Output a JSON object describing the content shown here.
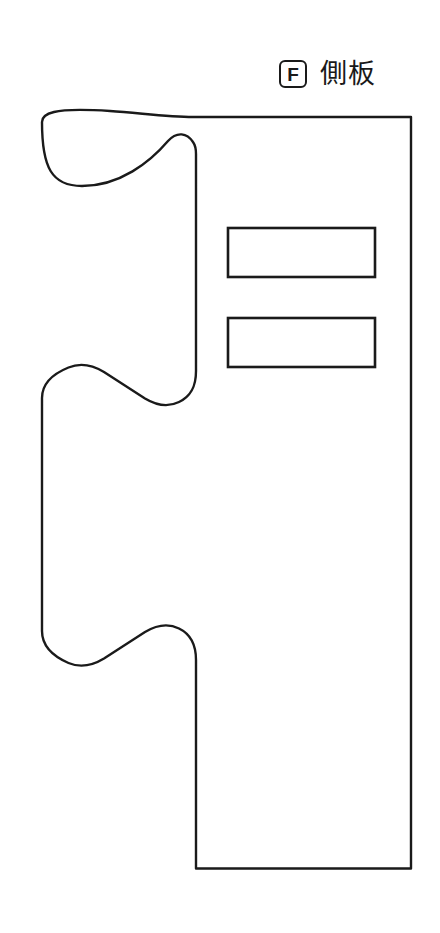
{
  "page": {
    "background_color": "#ffffff",
    "line_color": "#1a1a1a",
    "width": 440,
    "height": 933
  },
  "header": {
    "part_letter": "F",
    "part_name": "側板",
    "badge_icon_name": "part-letter-badge"
  },
  "drawing": {
    "type": "technical-outline",
    "description": "side-panel cut template outline",
    "fill_color": "#ffffff",
    "stroke_color": "#1a1a1a",
    "stroke_width": 2.4,
    "outline_path": "M 42 122 C 42 170 50 185 78 185 C 118 185 152 160 170 140 C 178 132 186 135 193 143 C 195.5 146 196 149 196 153 L 196 372 C 196 386 192 395 180 401 C 168 407 156 404 146 398 L 104 371 C 92 364 80 362 68 367 C 52 374 42 383 42 398 L 42 630 C 42 646 52 657 68 664 C 80 669 92 667 104 660 L 146 633 C 156 627 168 624 180 630 C 192 636 196 645 196 659 L 196 868 L 411 868 L 411 117 L 193 117 C 160 117 120 110 88 110 C 58 110 42 104 42 122 Z",
    "slots": [
      {
        "name": "upper-slot",
        "x": 228,
        "y": 228,
        "width": 147,
        "height": 49
      },
      {
        "name": "lower-slot",
        "x": 228,
        "y": 318,
        "width": 147,
        "height": 49
      }
    ],
    "outline_points": {
      "top_left_start": [
        42,
        118
      ],
      "top_right_corner": [
        411,
        117
      ],
      "bottom_right_corner": [
        411,
        869
      ],
      "bottom_left_corner": [
        190,
        869
      ],
      "left_edge_x": 42,
      "inner_edge_x": 196
    }
  }
}
